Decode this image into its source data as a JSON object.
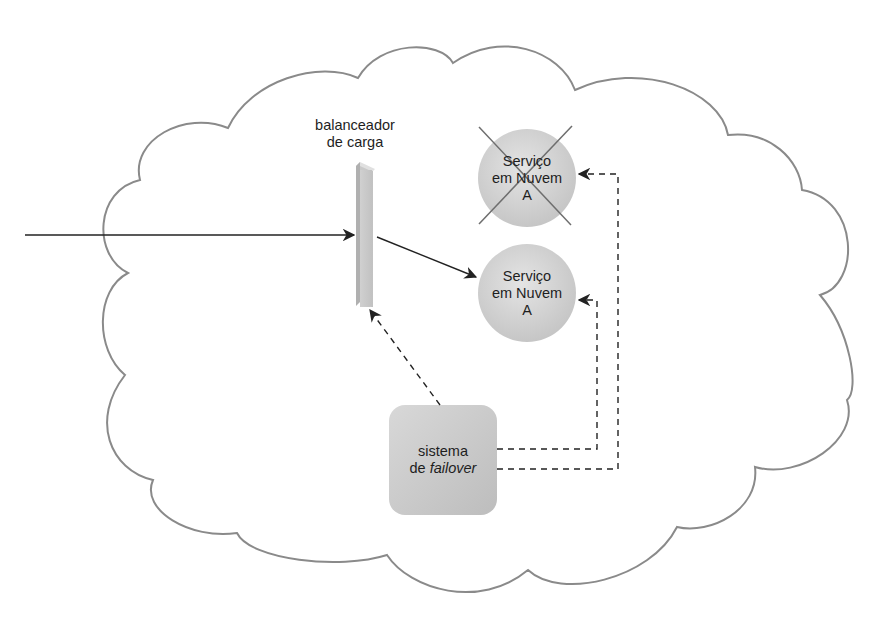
{
  "figure": {
    "type": "diagram",
    "description_visible": "cloud containing load balancer, two cloud services and a failover system"
  },
  "load_balancer": {
    "line1": "balanceador",
    "line2": "de carga"
  },
  "services": [
    {
      "line1": "Serviço",
      "line2": "em Nuvem",
      "line3": "A",
      "status": "failed",
      "crossed_out": true
    },
    {
      "line1": "Serviço",
      "line2": "em Nuvem",
      "line3": "A",
      "status": "active",
      "crossed_out": false
    }
  ],
  "failover": {
    "line1": "sistema",
    "line2_prefix": "de ",
    "line2_italic": "failover"
  },
  "colors": {
    "cloud_outline": "#8a8a8a",
    "node_fill": "#cfcfcf",
    "node_fill_light": "#e2e2e2",
    "arrow": "#222222",
    "cross": "#6e6e6e",
    "text": "#1e1e1e"
  }
}
